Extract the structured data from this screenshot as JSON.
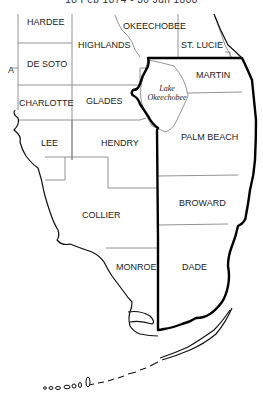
{
  "header": {
    "text": "18 Feb 1874 - 30 Jun 1888"
  },
  "map": {
    "title": "South Florida county boundaries",
    "highlight_color": "#000000",
    "counties": [
      {
        "name": "HARDEE"
      },
      {
        "name": "HIGHLANDS"
      },
      {
        "name": "OKEECHOBEE"
      },
      {
        "name": "ST. LUCIE"
      },
      {
        "name": "DE SOTO"
      },
      {
        "name": "MARTIN"
      },
      {
        "name": "CHARLOTTE"
      },
      {
        "name": "GLADES"
      },
      {
        "name": "LEE"
      },
      {
        "name": "HENDRY"
      },
      {
        "name": "PALM BEACH"
      },
      {
        "name": "BROWARD"
      },
      {
        "name": "COLLIER"
      },
      {
        "name": "MONROE"
      },
      {
        "name": "DADE"
      },
      {
        "name": "A"
      }
    ],
    "water": [
      {
        "name": "Lake Okeechobee",
        "line1": "Lake",
        "line2": "Okeechobee"
      }
    ]
  }
}
